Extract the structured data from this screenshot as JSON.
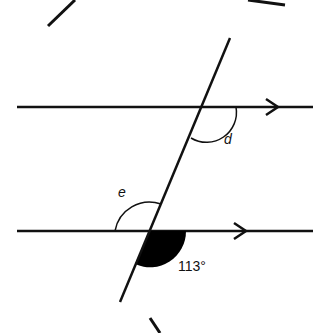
{
  "diagram": {
    "type": "parallel-lines-transversal",
    "labels": {
      "angle_d": "d",
      "angle_e": "e",
      "given_angle": "113°"
    },
    "given_angle_value": 113,
    "colors": {
      "line": "#111111",
      "filled_angle": "#000000"
    }
  }
}
